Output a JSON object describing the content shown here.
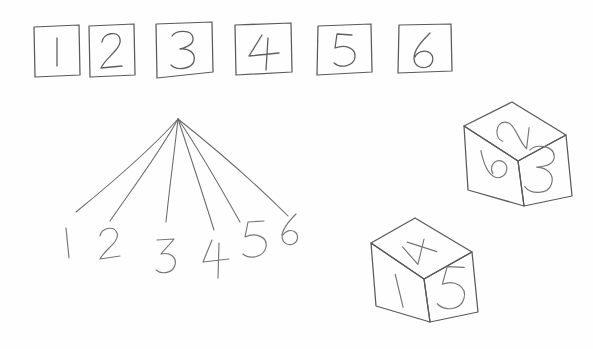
{
  "scene": {
    "title": "Hand-drawn dice sample space sketch",
    "medium": "pencil-on-paper sketch",
    "background_color": "#fefefe",
    "ink_color": "#5a5a5a",
    "width": 593,
    "height": 349
  },
  "box_row": {
    "name": "row-of-numbered-boxes",
    "count": 6,
    "boxes": [
      {
        "label": "1",
        "x": 34,
        "y": 26,
        "w": 46,
        "h": 50
      },
      {
        "label": "2",
        "x": 88,
        "y": 24,
        "w": 47,
        "h": 52
      },
      {
        "label": "3",
        "x": 155,
        "y": 22,
        "w": 58,
        "h": 56
      },
      {
        "label": "4",
        "x": 234,
        "y": 23,
        "w": 58,
        "h": 52
      },
      {
        "label": "5",
        "x": 317,
        "y": 24,
        "w": 55,
        "h": 51
      },
      {
        "label": "6",
        "x": 398,
        "y": 23,
        "w": 54,
        "h": 50
      }
    ]
  },
  "fan_diagram": {
    "name": "six-branch-fan-diagram",
    "apex": {
      "x": 178,
      "y": 119
    },
    "branch_count": 6,
    "branches": [
      {
        "label": "1",
        "end_x": 76,
        "end_y": 212,
        "label_x": 68,
        "label_y": 243
      },
      {
        "label": "2",
        "end_x": 110,
        "end_y": 221,
        "label_x": 110,
        "label_y": 249
      },
      {
        "label": "3",
        "end_x": 166,
        "end_y": 222,
        "label_x": 168,
        "label_y": 256
      },
      {
        "label": "4",
        "end_x": 214,
        "end_y": 230,
        "label_x": 217,
        "label_y": 262
      },
      {
        "label": "5",
        "end_x": 240,
        "end_y": 222,
        "label_x": 254,
        "label_y": 245
      },
      {
        "label": "6",
        "end_x": 288,
        "end_y": 216,
        "label_x": 290,
        "label_y": 240
      }
    ]
  },
  "dice": [
    {
      "name": "upper-die",
      "position": "upper-right",
      "faces": {
        "top": "2",
        "left": "6",
        "right": "3"
      },
      "vertices": {
        "top": {
          "x": 512,
          "y": 102
        },
        "left": {
          "x": 464,
          "y": 126
        },
        "right": {
          "x": 566,
          "y": 135
        },
        "center": {
          "x": 518,
          "y": 161
        },
        "bottom_left": {
          "x": 470,
          "y": 190
        },
        "bottom": {
          "x": 526,
          "y": 206
        },
        "bottom_right": {
          "x": 572,
          "y": 196
        }
      }
    },
    {
      "name": "lower-die",
      "position": "lower-center-right",
      "faces": {
        "top": "4",
        "left": "1",
        "right": "5"
      },
      "vertices": {
        "top": {
          "x": 415,
          "y": 218
        },
        "left": {
          "x": 371,
          "y": 243
        },
        "right": {
          "x": 472,
          "y": 252
        },
        "center": {
          "x": 424,
          "y": 279
        },
        "bottom_left": {
          "x": 377,
          "y": 306
        },
        "bottom": {
          "x": 430,
          "y": 322
        },
        "bottom_right": {
          "x": 478,
          "y": 312
        }
      }
    }
  ],
  "accessibility": {
    "description": "Pencil sketch: a row of six squares labelled 1 through 6, a fan of six lines from a single point down to the labels 1 2 3 4 5 6, and two isometric dice. The upper die shows 2 on top, 6 on the left face and 3 on the right face. The lower die shows 4 on top, 1 on the left face and 5 on the right face."
  }
}
